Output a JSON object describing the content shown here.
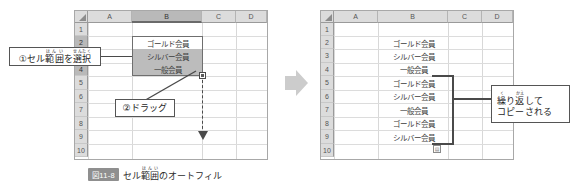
{
  "figure": {
    "caption_badge": "図11-8",
    "caption_text": "セル範囲のオートフィル",
    "caption_ruby_base": "範囲",
    "caption_ruby_text": "はんい",
    "transition_arrow_icon": "right-arrow-icon"
  },
  "columns": [
    "A",
    "B",
    "C",
    "D"
  ],
  "rows": [
    "1",
    "2",
    "3",
    "4",
    "5",
    "6",
    "7",
    "8",
    "9",
    "10"
  ],
  "before": {
    "selected_column": "B",
    "selected_rows": [
      "2",
      "3",
      "4"
    ],
    "active_cell_row": "2",
    "cells": [
      {
        "row": "2",
        "col": "B",
        "value": "ゴールド会員",
        "state": "active"
      },
      {
        "row": "3",
        "col": "B",
        "value": "シルバー会員",
        "state": "selected"
      },
      {
        "row": "4",
        "col": "B",
        "value": "一般会員",
        "state": "selected"
      }
    ],
    "fill_handle_icon": "fill-handle-icon",
    "drag_arrow_icon": "dashed-down-arrow-icon",
    "callout_1": {
      "number": "①",
      "text": "セル範囲を選択",
      "ruby": [
        {
          "base": "範囲",
          "text": "はんい"
        },
        {
          "base": "選択",
          "text": "せんたく"
        }
      ],
      "segments": [
        "①セル",
        "範囲",
        "を",
        "選択"
      ]
    },
    "callout_2": {
      "number": "②",
      "text": "②ドラッグ"
    }
  },
  "after": {
    "cells": [
      {
        "row": "2",
        "col": "B",
        "value": "ゴールド会員"
      },
      {
        "row": "3",
        "col": "B",
        "value": "シルバー会員"
      },
      {
        "row": "4",
        "col": "B",
        "value": "一般会員"
      },
      {
        "row": "5",
        "col": "B",
        "value": "ゴールド会員"
      },
      {
        "row": "6",
        "col": "B",
        "value": "シルバー会員"
      },
      {
        "row": "7",
        "col": "B",
        "value": "一般会員"
      },
      {
        "row": "8",
        "col": "B",
        "value": "ゴールド会員"
      },
      {
        "row": "9",
        "col": "B",
        "value": "シルバー会員"
      }
    ],
    "bracket_range_rows": [
      "5",
      "9"
    ],
    "autofill_options_icon": "autofill-options-icon",
    "callout_3": {
      "line1": "繰り返して",
      "line2": "コピーされる",
      "ruby": [
        {
          "base": "繰",
          "text": "く"
        },
        {
          "base": "返",
          "text": "かえ"
        }
      ],
      "line1_segments": [
        "繰",
        "り",
        "返",
        "して"
      ]
    }
  },
  "colors": {
    "header_fill": "#dcdcdc",
    "header_selected_fill": "#b9b9b9",
    "selection_fill": "#bcbcbc",
    "grid_line": "#dcdcdc",
    "border": "#a8a8a8",
    "ink": "#4a4a4a",
    "transition_arrow": "#cccccc",
    "caption_badge": "#8f8f8f"
  }
}
